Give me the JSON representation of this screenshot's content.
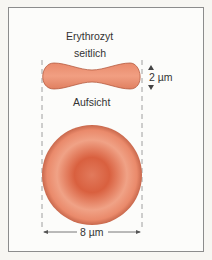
{
  "figure": {
    "title": "Erythrozyt",
    "side_view_label": "seitlich",
    "top_view_label": "Aufsicht",
    "thickness_label": "2 µm",
    "diameter_label": "8 µm"
  },
  "colors": {
    "frame_border": "#8c8c8c",
    "background": "#fcfcfa",
    "cell_edge": "#e88a6a",
    "cell_center": "#d85a3c",
    "cell_rim_highlight": "#f1a184",
    "dimension_lines": "#555555",
    "text": "#333333"
  }
}
